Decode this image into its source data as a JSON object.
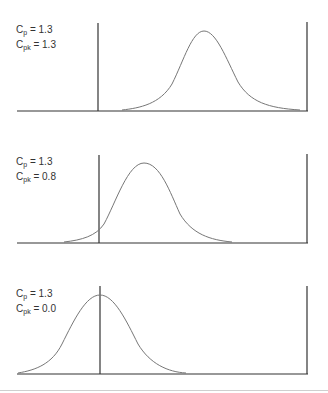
{
  "panels": [
    {
      "cp_label": "C",
      "cp_sub": "p",
      "cp_value": " = 1.3",
      "cpk_label": "C",
      "cpk_sub": "pk",
      "cpk_value": " = 1.3",
      "cp": 1.3,
      "cpk": 1.3
    },
    {
      "cp_label": "C",
      "cp_sub": "p",
      "cp_value": " = 1.3",
      "cpk_label": "C",
      "cpk_sub": "pk",
      "cpk_value": " = 0.8",
      "cp": 1.3,
      "cpk": 0.8
    },
    {
      "cp_label": "C",
      "cp_sub": "p",
      "cp_value": " = 1.3",
      "cpk_label": "C",
      "cpk_sub": "pk",
      "cpk_value": " = 0.0",
      "cp": 1.3,
      "cpk": 0.0
    }
  ],
  "colors": {
    "axis": "#333333",
    "curve": "#777777",
    "rule": "#cfcfcf"
  }
}
